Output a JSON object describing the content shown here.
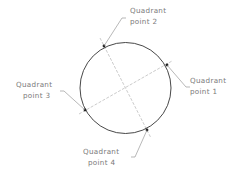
{
  "diagram": {
    "circle": {
      "cx": 125.5,
      "cy": 88,
      "r": 45.5,
      "stroke": "#333333"
    },
    "centerlines_color": "#b0b0b0",
    "labels": [
      {
        "id": "q1",
        "line1": "Quadrant",
        "line2": "point  1"
      },
      {
        "id": "q2",
        "line1": "Quadrant",
        "line2": "point  2"
      },
      {
        "id": "q3",
        "line1": "Quadrant",
        "line2": "point  3"
      },
      {
        "id": "q4",
        "line1": "Quadrant",
        "line2": "point  4"
      }
    ]
  }
}
